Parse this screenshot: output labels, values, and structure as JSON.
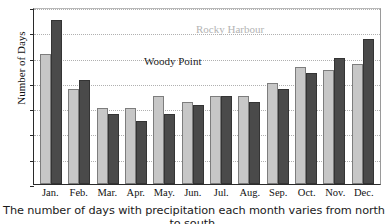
{
  "chart_data": {
    "type": "bar",
    "title": "",
    "xlabel": "",
    "ylabel": "Number of Days",
    "ylim": [
      0,
      28
    ],
    "yticks": [
      0,
      4,
      8,
      12,
      16,
      20,
      24,
      28
    ],
    "grid": true,
    "legend_position": "inside-plot",
    "categories": [
      "Jan.",
      "Feb.",
      "Mar.",
      "Apr.",
      "May.",
      "Jun.",
      "Jul.",
      "Aug.",
      "Sep.",
      "Oct.",
      "Nov.",
      "Dec."
    ],
    "series": [
      {
        "name": "Rocky Harbour",
        "color": "#c7c7c7",
        "values": [
          20.5,
          15,
          12,
          12,
          14,
          13,
          14,
          14,
          16,
          18.5,
          18,
          19
        ]
      },
      {
        "name": "Woody Point",
        "color": "#4a4a4a",
        "values": [
          26,
          16.5,
          11,
          10,
          11,
          12.5,
          14,
          13,
          15,
          17.5,
          20,
          23
        ]
      }
    ],
    "annotations": [
      {
        "text": "Rocky Harbour",
        "color": "#b3b3b3"
      },
      {
        "text": "Woody Point",
        "color": "#1d1d1d"
      }
    ],
    "caption": "The number of days with precipitation each month varies from north to south."
  }
}
